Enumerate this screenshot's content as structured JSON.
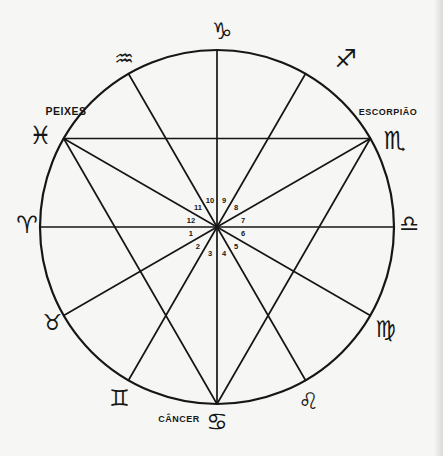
{
  "figure_type": "zodiac-house-wheel",
  "background_color": "#f6f6f4",
  "ink_color": "#161616",
  "wheel": {
    "center_x": 217,
    "center_y": 227,
    "radius": 177,
    "circle_stroke_width": 2.2,
    "line_stroke_width": 1.7
  },
  "signs": [
    {
      "id": "aries",
      "symbol": "♈",
      "angle": 180,
      "symbol_radius": 190,
      "nudge": [
        0,
        -2
      ],
      "symbol_size": 24
    },
    {
      "id": "taurus",
      "symbol": "♉",
      "angle": 210,
      "symbol_radius": 190,
      "nudge": [
        0,
        0
      ],
      "symbol_size": 22
    },
    {
      "id": "gemini",
      "symbol": "♊",
      "angle": 240,
      "symbol_radius": 197,
      "nudge": [
        1,
        0
      ],
      "symbol_size": 23
    },
    {
      "id": "cancer",
      "symbol": "♋",
      "angle": 270,
      "symbol_radius": 195,
      "nudge": [
        0,
        0
      ],
      "symbol_size": 24,
      "label": "CÂNCER",
      "label_x": 179,
      "label_y": 419,
      "label_size": 9
    },
    {
      "id": "leo",
      "symbol": "♌",
      "angle": 300,
      "symbol_radius": 197,
      "nudge": [
        -7,
        3
      ],
      "symbol_size": 23
    },
    {
      "id": "virgo",
      "symbol": "♍",
      "angle": 330,
      "symbol_radius": 197,
      "nudge": [
        -2,
        3
      ],
      "symbol_size": 23
    },
    {
      "id": "libra",
      "symbol": "♎",
      "angle": 0,
      "symbol_radius": 192,
      "nudge": [
        0,
        -4
      ],
      "symbol_size": 22
    },
    {
      "id": "scorpio",
      "symbol": "♏",
      "angle": 30,
      "symbol_radius": 198,
      "nudge": [
        6,
        12
      ],
      "symbol_size": 25,
      "label": "ESCORPIÃO",
      "label_x": 388,
      "label_y": 112,
      "label_size": 9
    },
    {
      "id": "sagittarius",
      "symbol": "♐",
      "angle": 60,
      "symbol_radius": 196,
      "nudge": [
        31,
        1
      ],
      "symbol_size": 25
    },
    {
      "id": "capricorn",
      "symbol": "♑",
      "angle": 90,
      "symbol_radius": 196,
      "nudge": [
        5,
        0
      ],
      "symbol_size": 23
    },
    {
      "id": "aquarius",
      "symbol": "♒",
      "angle": 120,
      "symbol_radius": 196,
      "nudge": [
        5,
        1
      ],
      "symbol_size": 22
    },
    {
      "id": "pisces",
      "symbol": "♓",
      "angle": 150,
      "symbol_radius": 198,
      "nudge": [
        -5,
        7
      ],
      "symbol_size": 25,
      "label": "PEIXES",
      "label_x": 66,
      "label_y": 111,
      "label_size": 10.5
    }
  ],
  "house_numbers": {
    "values": [
      "1",
      "2",
      "3",
      "4",
      "5",
      "6",
      "7",
      "8",
      "9",
      "10",
      "11",
      "12"
    ],
    "ring_radius": 27,
    "font_size": 7.5,
    "first_angle": 195,
    "step_angle": 30
  },
  "aspect_lines": [
    {
      "from": "capricorn",
      "to": "cancer"
    },
    {
      "from": "aquarius",
      "to": "leo"
    },
    {
      "from": "pisces",
      "to": "virgo"
    },
    {
      "from": "aries",
      "to": "libra"
    },
    {
      "from": "taurus",
      "to": "scorpio"
    },
    {
      "from": "gemini",
      "to": "sagittarius"
    },
    {
      "from": "pisces",
      "to": "scorpio"
    },
    {
      "from": "scorpio",
      "to": "cancer"
    },
    {
      "from": "cancer",
      "to": "pisces"
    }
  ]
}
